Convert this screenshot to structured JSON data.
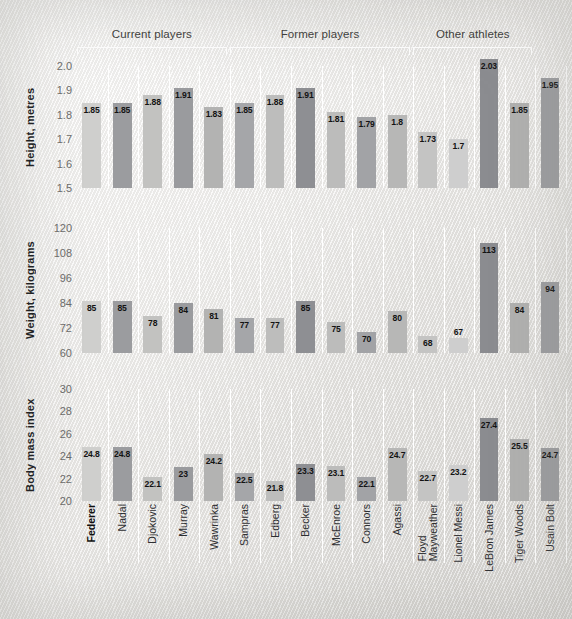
{
  "groups": [
    {
      "label": "Current players",
      "start": 0,
      "end": 4
    },
    {
      "label": "Former players",
      "start": 5,
      "end": 10
    },
    {
      "label": "Other athletes",
      "start": 11,
      "end": 14
    }
  ],
  "athletes": [
    {
      "name": "Federer",
      "bold": true
    },
    {
      "name": "Nadal",
      "bold": false
    },
    {
      "name": "Djokovic",
      "bold": false
    },
    {
      "name": "Murray",
      "bold": false
    },
    {
      "name": "Wawrinka",
      "bold": false
    },
    {
      "name": "Sampras",
      "bold": false
    },
    {
      "name": "Edberg",
      "bold": false
    },
    {
      "name": "Becker",
      "bold": false
    },
    {
      "name": "McEnroe",
      "bold": false
    },
    {
      "name": "Connors",
      "bold": false
    },
    {
      "name": "Agassi",
      "bold": false
    },
    {
      "name": "Floyd\nMayweather",
      "bold": false
    },
    {
      "name": "Lionel Messi",
      "bold": false
    },
    {
      "name": "LeBron James",
      "bold": false
    },
    {
      "name": "Tiger Woods",
      "bold": false
    },
    {
      "name": "Usain Bolt",
      "bold": false
    }
  ],
  "chart_data": [
    {
      "type": "bar",
      "title": "Height, metres",
      "ylabel": "Height, metres",
      "xlabel": "",
      "ylim": [
        1.5,
        2.0
      ],
      "yticks": [
        "2.0",
        "1.9",
        "1.8",
        "1.7",
        "1.6",
        "1.5"
      ],
      "ytick_values": [
        2.0,
        1.9,
        1.8,
        1.7,
        1.6,
        1.5
      ],
      "grid": false,
      "categories": [
        "Federer",
        "Nadal",
        "Djokovic",
        "Murray",
        "Wawrinka",
        "Sampras",
        "Edberg",
        "Becker",
        "McEnroe",
        "Connors",
        "Agassi",
        "Floyd Mayweather",
        "Lionel Messi",
        "LeBron James",
        "Tiger Woods",
        "Usain Bolt"
      ],
      "values": [
        1.85,
        1.85,
        1.88,
        1.91,
        1.83,
        1.85,
        1.88,
        1.91,
        1.81,
        1.79,
        1.8,
        1.73,
        1.7,
        2.03,
        1.85,
        1.95
      ],
      "labels": [
        "1.85",
        "1.85",
        "1.88",
        "1.91",
        "1.83",
        "1.85",
        "1.88",
        "1.91",
        "1.81",
        "1.79",
        "1.8",
        "1.73",
        "1.7",
        "2.03",
        "1.85",
        "1.95"
      ]
    },
    {
      "type": "bar",
      "title": "Weight, kilograms",
      "ylabel": "Weight, kilograms",
      "xlabel": "",
      "ylim": [
        60,
        120
      ],
      "yticks": [
        "120",
        "108",
        "96",
        "84",
        "72",
        "60"
      ],
      "ytick_values": [
        120,
        108,
        96,
        84,
        72,
        60
      ],
      "grid": false,
      "categories": [
        "Federer",
        "Nadal",
        "Djokovic",
        "Murray",
        "Wawrinka",
        "Sampras",
        "Edberg",
        "Becker",
        "McEnroe",
        "Connors",
        "Agassi",
        "Floyd Mayweather",
        "Lionel Messi",
        "LeBron James",
        "Tiger Woods",
        "Usain Bolt"
      ],
      "values": [
        85,
        85,
        78,
        84,
        81,
        77,
        77,
        85,
        75,
        70,
        80,
        68,
        67,
        113,
        84,
        94
      ],
      "labels": [
        "85",
        "85",
        "78",
        "84",
        "81",
        "77",
        "77",
        "85",
        "75",
        "70",
        "80",
        "68",
        "67",
        "113",
        "84",
        "94"
      ]
    },
    {
      "type": "bar",
      "title": "Body mass index",
      "ylabel": "Body mass index",
      "xlabel": "",
      "ylim": [
        20,
        30
      ],
      "yticks": [
        "30",
        "28",
        "26",
        "24",
        "22",
        "20"
      ],
      "ytick_values": [
        30,
        28,
        26,
        24,
        22,
        20
      ],
      "grid": false,
      "categories": [
        "Federer",
        "Nadal",
        "Djokovic",
        "Murray",
        "Wawrinka",
        "Sampras",
        "Edberg",
        "Becker",
        "McEnroe",
        "Connors",
        "Agassi",
        "Floyd Mayweather",
        "Lionel Messi",
        "LeBron James",
        "Tiger Woods",
        "Usain Bolt"
      ],
      "values": [
        24.8,
        24.8,
        22.1,
        23,
        24.2,
        22.5,
        21.8,
        23.3,
        23.1,
        22.1,
        24.7,
        22.7,
        23.2,
        27.4,
        25.5,
        24.7
      ],
      "labels": [
        "24.8",
        "24.8",
        "22.1",
        "23",
        "24.2",
        "22.5",
        "21.8",
        "23.3",
        "23.1",
        "22.1",
        "24.7",
        "22.7",
        "23.2",
        "27.4",
        "25.5",
        "24.7"
      ]
    }
  ],
  "colors": {
    "background": "#edecea",
    "bar_light": "#c9c9c7",
    "bar_dark": "#8f9093",
    "separator": "#ffffff",
    "tick_text": "#6c6c6a",
    "title_text": "#17181a"
  }
}
